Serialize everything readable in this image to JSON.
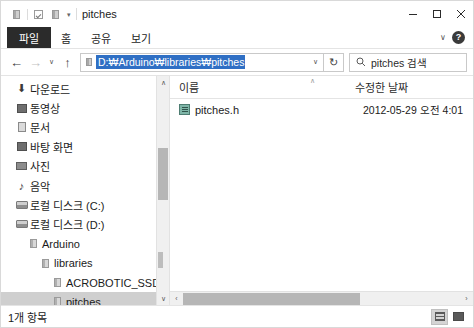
{
  "window": {
    "title": "pitches",
    "quick_access": [
      {
        "name": "folder-icon",
        "glyph": "folder"
      },
      {
        "name": "properties-check-icon",
        "glyph": "check"
      },
      {
        "name": "new-folder-icon",
        "glyph": "folder"
      }
    ],
    "qat_caret": "▾",
    "controls": {
      "minimize": "—",
      "maximize": "□",
      "close": "✕"
    }
  },
  "ribbon": {
    "tabs": [
      {
        "label": "파일",
        "active": true
      },
      {
        "label": "홈",
        "active": false
      },
      {
        "label": "공유",
        "active": false
      },
      {
        "label": "보기",
        "active": false
      }
    ],
    "expand_caret": "∨",
    "help_label": "?"
  },
  "address": {
    "back": "←",
    "forward": "→",
    "recent": "∨",
    "up": "↑",
    "path": "D:₩Arduino₩libraries₩pitches",
    "dropdown": "∨",
    "refresh": "↻"
  },
  "search": {
    "icon": "⌕",
    "placeholder": "pitches 검색"
  },
  "sidebar": {
    "items": [
      {
        "label": "다운로드",
        "icon": "download-icon",
        "indent": 12,
        "selected": false
      },
      {
        "label": "동영상",
        "icon": "video-icon",
        "indent": 12,
        "selected": false
      },
      {
        "label": "문서",
        "icon": "document-icon",
        "indent": 12,
        "selected": false
      },
      {
        "label": "바탕 화면",
        "icon": "desktop-icon",
        "indent": 12,
        "selected": false
      },
      {
        "label": "사진",
        "icon": "pictures-icon",
        "indent": 12,
        "selected": false
      },
      {
        "label": "음악",
        "icon": "music-icon",
        "indent": 12,
        "selected": false
      },
      {
        "label": "로컬 디스크 (C:)",
        "icon": "drive-icon",
        "indent": 12,
        "selected": false
      },
      {
        "label": "로컬 디스크 (D:)",
        "icon": "drive-icon",
        "indent": 12,
        "selected": false
      },
      {
        "label": "Arduino",
        "icon": "folder-icon",
        "indent": 24,
        "selected": false
      },
      {
        "label": "libraries",
        "icon": "folder-icon",
        "indent": 36,
        "selected": false
      },
      {
        "label": "ACROBOTIC_SSD1306",
        "icon": "folder-icon",
        "indent": 48,
        "selected": false
      },
      {
        "label": "pitches",
        "icon": "folder-icon",
        "indent": 48,
        "selected": true
      },
      {
        "label": "RTCZero-master",
        "icon": "folder-icon",
        "indent": 48,
        "selected": false
      },
      {
        "label": "myBlink",
        "icon": "folder-icon",
        "indent": 36,
        "selected": false
      }
    ],
    "scroll_up": "∧",
    "scroll_down": "∨"
  },
  "list": {
    "columns": [
      {
        "label": "이름",
        "key": "name"
      },
      {
        "label": "수정한 날짜",
        "key": "date"
      }
    ],
    "sort_indicator": "∧",
    "rows": [
      {
        "name": "pitches.h",
        "date": "2012-05-29 오전 4:01",
        "icon": "header-file-icon"
      }
    ],
    "hscroll_left": "‹",
    "hscroll_right": "›"
  },
  "status": {
    "item_count": "1개 항목",
    "views": [
      {
        "name": "details-view-button",
        "active": true
      },
      {
        "name": "large-icons-view-button",
        "active": false
      }
    ]
  },
  "colors": {
    "selection_blue": "#2f6fc4",
    "tree_selection": "#cfcfcf",
    "file_tab": "#2b2b2b"
  }
}
